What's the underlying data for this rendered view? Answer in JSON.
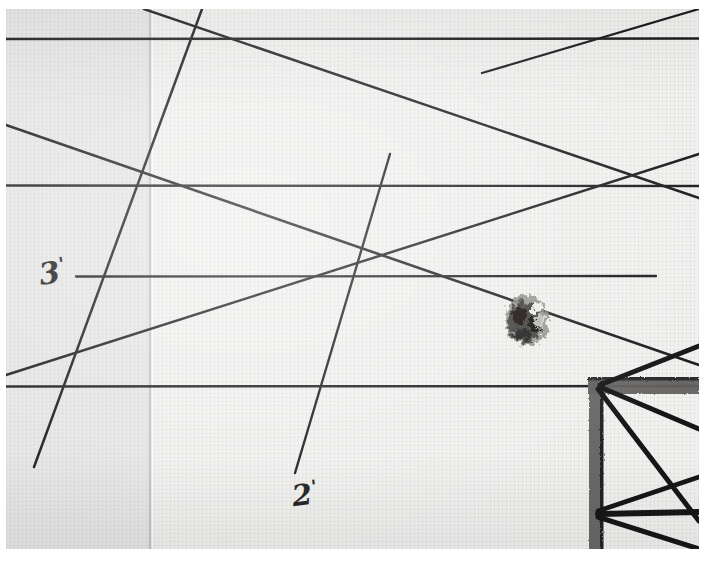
{
  "document": {
    "kind": "scanned-hand-drawing",
    "medium": "graph paper",
    "orientation": "landscape"
  },
  "annotations": {
    "dimension_left": {
      "value": "3",
      "unit_mark": "'",
      "full": "3'"
    },
    "dimension_bottom": {
      "value": "2",
      "unit_mark": "'",
      "full": "2'"
    }
  },
  "marks": {
    "ink_blot": "ink-blot",
    "structural_corner": "structural-corner-joint",
    "fold_crease": "vertical-fold-crease"
  },
  "colors": {
    "paper": "#f2f2f0",
    "paper_shadow": "#e6e6e4",
    "ink": "#1d1d1d",
    "crease": "#c9c9c9",
    "beam": "#5a5a58",
    "border": "#ffffff"
  },
  "geometry": {
    "nodes": [
      {
        "name": "node-top-left",
        "x": 219,
        "y": 38
      },
      {
        "name": "node-top-right",
        "x": 620,
        "y": 38
      },
      {
        "name": "node-mid-left",
        "x": 152,
        "y": 185
      },
      {
        "name": "node-mid-right",
        "x": 608,
        "y": 186
      },
      {
        "name": "node-center",
        "x": 358,
        "y": 280
      },
      {
        "name": "node-lower-left",
        "x": 60,
        "y": 388
      },
      {
        "name": "node-corner-joint",
        "x": 601,
        "y": 385
      }
    ],
    "horizontals": [
      {
        "name": "horizontal-top",
        "y": 38,
        "x1": 8,
        "x2": 697
      },
      {
        "name": "horizontal-upper",
        "y": 185,
        "x1": 8,
        "x2": 697
      },
      {
        "name": "horizontal-middle",
        "y": 276,
        "x1": 76,
        "x2": 657
      },
      {
        "name": "horizontal-lower",
        "y": 386,
        "x1": 8,
        "x2": 697
      }
    ],
    "diagonals": [
      {
        "name": "diagonal-a",
        "x1": 200,
        "y1": 8,
        "x2": 35,
        "y2": 465
      },
      {
        "name": "diagonal-b",
        "x1": 8,
        "y1": 124,
        "x2": 697,
        "y2": 363
      },
      {
        "name": "diagonal-c",
        "x1": 390,
        "y1": 153,
        "x2": 295,
        "y2": 470
      },
      {
        "name": "diagonal-d",
        "x1": 8,
        "y1": 373,
        "x2": 697,
        "y2": 152
      },
      {
        "name": "diagonal-e",
        "x1": 144,
        "y1": 8,
        "x2": 697,
        "y2": 196
      },
      {
        "name": "diagonal-f",
        "x1": 697,
        "y1": 8,
        "x2": 480,
        "y2": 72
      }
    ],
    "beam": {
      "x": 588,
      "y": 378,
      "width": 109,
      "thickness": 16,
      "leg_width": 15,
      "leg_height": 175
    },
    "crease": {
      "x": 150,
      "y1": 8,
      "y2": 549
    }
  }
}
